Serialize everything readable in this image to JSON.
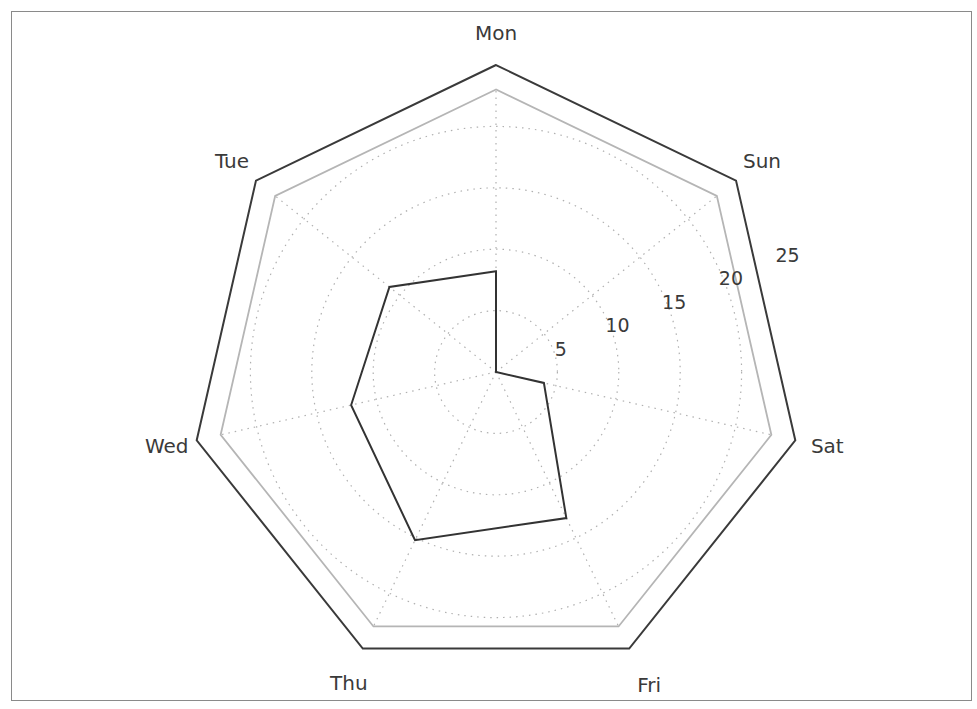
{
  "chart_data": {
    "type": "radar",
    "title": "",
    "categories": [
      "Mon",
      "Tue",
      "Wed",
      "Thu",
      "Fri",
      "Sat",
      "Sun"
    ],
    "series": [
      {
        "name": "series",
        "values": [
          8.2,
          11.1,
          12.1,
          15.2,
          13.2,
          4.0,
          0.0
        ],
        "color": "#333333"
      }
    ],
    "radial_ticks": [
      5,
      10,
      15,
      20,
      25
    ],
    "radial_tick_labels": [
      "5",
      "10",
      "15",
      "20",
      "25"
    ],
    "rlim": [
      0,
      25
    ],
    "inner_frame_value": 23,
    "grid": true,
    "grid_style": "dotted",
    "legend": null,
    "colors": {
      "series_line": "#333333",
      "outer_frame": "#3a3a3a",
      "inner_frame": "#b5b5b5",
      "grid": "#b0b0b0",
      "figure_border": "#8a8a8a"
    }
  }
}
